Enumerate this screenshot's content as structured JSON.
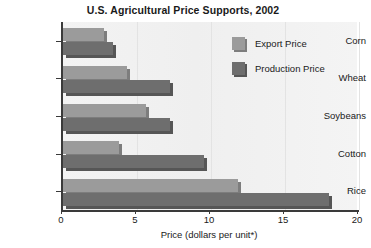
{
  "chart_data": {
    "type": "bar",
    "orientation": "horizontal",
    "title": "U.S. Agricultural Price Supports, 2002",
    "xlabel": "Price (dollars per unit*)",
    "ylabel": "",
    "xlim": [
      0,
      20
    ],
    "xticks": [
      "0",
      "5",
      "10",
      "15",
      "20"
    ],
    "grid": true,
    "legend_position": "upper right",
    "categories": [
      "Corn",
      "Wheat",
      "Soybeans",
      "Cotton",
      "Rice"
    ],
    "series": [
      {
        "name": "Export Price",
        "color": "#9b9b9b",
        "values": [
          2.8,
          4.3,
          5.6,
          3.8,
          11.8
        ]
      },
      {
        "name": "Production Price",
        "color": "#6e6e6e",
        "values": [
          3.4,
          7.2,
          7.2,
          9.5,
          18.0
        ]
      }
    ]
  }
}
